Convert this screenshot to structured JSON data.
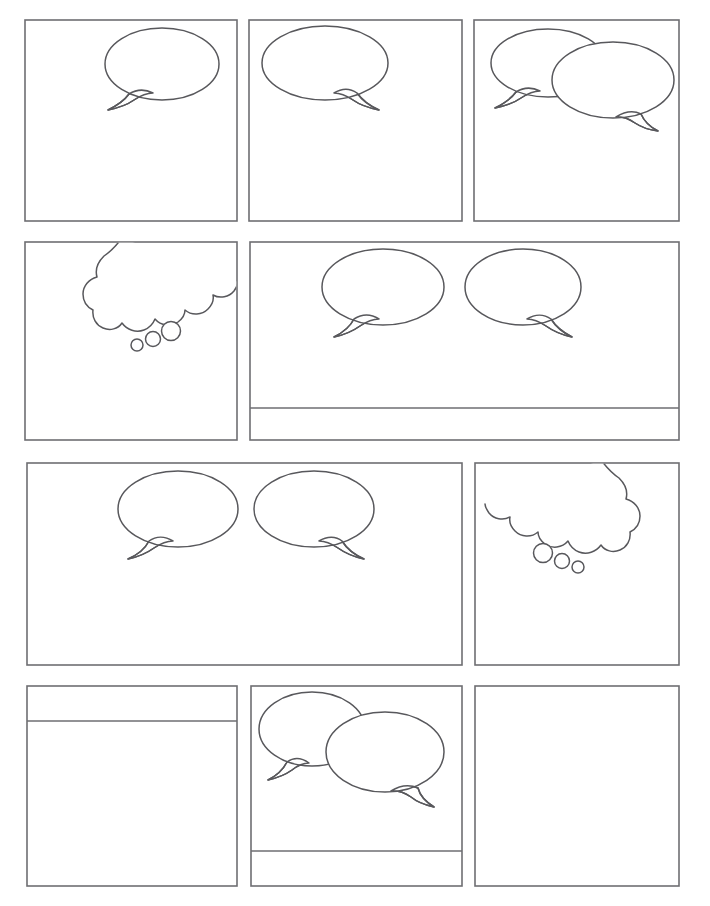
{
  "document": {
    "kind": "comic-page-template",
    "title": "Blank Comic Book Page Template",
    "page_width": 710,
    "page_height": 906,
    "background_color": "#ffffff",
    "panel_border_color": "#6e6e72",
    "bubble_line_color": "#58585c",
    "bubble_fill_color": "#ffffff",
    "panel_border_width": 1.6,
    "bubble_line_width": 1.5,
    "row_count": 4,
    "panel_count": 11,
    "text_content": []
  },
  "rows": [
    {
      "name": "row-1",
      "index": 1,
      "top": 20,
      "bottom": 221,
      "panel_count": 3,
      "panels": [
        {
          "name": "panel-1",
          "label": "1",
          "x": 25,
          "y": 20,
          "width": 212,
          "height": 201,
          "caption_bar": null,
          "balloons": [
            {
              "type": "speech",
              "cx": 162,
              "cy": 64,
              "rx": 57,
              "ry": 36,
              "tail": "lower-left",
              "tail_path": "M 129 94 C 124 101 116 106 108 110 C 118 108 127 105 134 100 C 140 96 146 93 153 93 C 145 89 137 89 129 94 Z",
              "z": 1
            }
          ]
        },
        {
          "name": "panel-2",
          "label": "2",
          "x": 249,
          "y": 20,
          "width": 213,
          "height": 201,
          "caption_bar": null,
          "balloons": [
            {
              "type": "speech",
              "cx": 325,
              "cy": 63,
              "rx": 63,
              "ry": 37,
              "tail": "lower-right",
              "tail_path": "M 357 93 C 362 100 370 106 379 110 C 369 108 360 105 353 100 C 347 96 341 93 334 93 C 342 88 350 88 357 93 Z",
              "z": 1
            }
          ]
        },
        {
          "name": "panel-3",
          "label": "3",
          "x": 474,
          "y": 20,
          "width": 205,
          "height": 201,
          "caption_bar": null,
          "balloons": [
            {
              "type": "speech",
              "cx": 548,
              "cy": 63,
              "rx": 57,
              "ry": 34,
              "tail": "lower-left",
              "tail_path": "M 516 92 C 511 99 503 104 495 108 C 505 106 514 103 521 98 C 527 94 533 91 540 91 C 532 87 524 87 516 92 Z",
              "z": 1
            },
            {
              "type": "speech",
              "cx": 613,
              "cy": 80,
              "rx": 61,
              "ry": 38,
              "tail": "lower-left",
              "tail_path": "M 641 114 C 644 121 650 127 658 131 C 649 130 641 127 635 123 C 629 119 623 116 616 117 C 624 112 633 110 641 114 Z",
              "z": 2
            }
          ]
        }
      ]
    },
    {
      "name": "row-2",
      "index": 2,
      "top": 242,
      "bottom": 440,
      "panel_count": 2,
      "panels": [
        {
          "name": "panel-4",
          "label": "4",
          "x": 25,
          "y": 242,
          "width": 212,
          "height": 198,
          "caption_bar": null,
          "balloons": [
            {
              "type": "thought",
              "orientation": "cloud-left-dots-down-left",
              "clipped_top": true,
              "cloud_path": "M 122 238 C 116 246 110 252 104 256 C 98 262 95 270 97 277 C 89 279 83 286 83 294 C 83 301 87 307 93 310 C 92 318 96 325 103 328 C 110 331 118 329 122 323 C 127 330 136 333 144 330 C 149 328 153 324 155 319 C 161 326 171 327 178 322 C 182 319 185 315 185 310 C 192 316 202 315 208 309 C 212 305 214 300 213 295 C 220 299 229 297 234 291 C 236 288 238 285 238 282",
              "dots": [
                {
                  "cx": 171,
                  "cy": 331,
                  "r": 9.5,
                  "index": 1
                },
                {
                  "cx": 153,
                  "cy": 339,
                  "r": 7.5,
                  "index": 2
                },
                {
                  "cx": 137,
                  "cy": 345,
                  "r": 6,
                  "index": 3
                }
              ],
              "z": 1
            }
          ]
        },
        {
          "name": "panel-5",
          "label": "5",
          "x": 250,
          "y": 242,
          "width": 429,
          "height": 198,
          "caption_bar": {
            "name": "caption-bottom",
            "divider_y": 408,
            "position": "bottom",
            "height": 32
          },
          "balloons": [
            {
              "type": "speech",
              "cx": 383,
              "cy": 287,
              "rx": 61,
              "ry": 38,
              "tail": "lower-left",
              "tail_path": "M 354 319 C 350 327 342 333 334 337 C 344 335 353 331 360 326 C 366 322 372 319 379 319 C 371 314 362 314 354 319 Z",
              "z": 1
            },
            {
              "type": "speech",
              "cx": 523,
              "cy": 287,
              "rx": 58,
              "ry": 38,
              "tail": "lower-right",
              "tail_path": "M 551 319 C 556 327 564 333 572 337 C 562 335 553 331 546 326 C 540 322 534 319 527 319 C 535 314 544 314 551 319 Z",
              "z": 1
            }
          ]
        }
      ]
    },
    {
      "name": "row-3",
      "index": 3,
      "top": 463,
      "bottom": 665,
      "panel_count": 2,
      "panels": [
        {
          "name": "panel-6",
          "label": "6",
          "x": 27,
          "y": 463,
          "width": 435,
          "height": 202,
          "caption_bar": null,
          "balloons": [
            {
              "type": "speech",
              "cx": 178,
              "cy": 509,
              "rx": 60,
              "ry": 38,
              "tail": "lower-left",
              "tail_path": "M 149 541 C 145 549 137 555 128 559 C 138 557 147 553 154 548 C 160 544 166 541 173 541 C 165 536 156 536 149 541 Z",
              "z": 1
            },
            {
              "type": "speech",
              "cx": 314,
              "cy": 509,
              "rx": 60,
              "ry": 38,
              "tail": "lower-right",
              "tail_path": "M 342 541 C 347 549 355 555 364 559 C 354 557 345 553 338 548 C 332 544 326 541 319 541 C 327 536 336 536 342 541 Z",
              "z": 1
            }
          ]
        },
        {
          "name": "panel-7",
          "label": "7",
          "x": 475,
          "y": 463,
          "width": 204,
          "height": 202,
          "caption_bar": null,
          "balloons": [
            {
              "type": "thought",
              "orientation": "cloud-right-dots-down-right",
              "clipped_top": true,
              "cloud_path": "M 601 460 C 607 468 613 474 619 478 C 625 484 628 492 626 499 C 634 501 640 508 640 516 C 640 523 636 529 630 532 C 631 540 627 547 620 550 C 613 553 605 551 601 545 C 596 552 587 555 579 552 C 574 550 570 546 568 541 C 562 548 552 549 545 544 C 541 541 538 537 538 532 C 531 538 521 537 515 531 C 511 527 509 522 510 517 C 503 521 494 519 489 513 C 487 510 485 507 485 504",
              "dots": [
                {
                  "cx": 543,
                  "cy": 553,
                  "r": 9.5,
                  "index": 1
                },
                {
                  "cx": 562,
                  "cy": 561,
                  "r": 7.5,
                  "index": 2
                },
                {
                  "cx": 578,
                  "cy": 567,
                  "r": 6,
                  "index": 3
                }
              ],
              "z": 1
            }
          ]
        }
      ]
    },
    {
      "name": "row-4",
      "index": 4,
      "top": 686,
      "bottom": 886,
      "panel_count": 3,
      "panels": [
        {
          "name": "panel-8",
          "label": "8",
          "x": 27,
          "y": 686,
          "width": 210,
          "height": 200,
          "caption_bar": {
            "name": "caption-top",
            "divider_y": 721,
            "position": "top",
            "height": 35
          },
          "balloons": []
        },
        {
          "name": "panel-9",
          "label": "9",
          "x": 251,
          "y": 686,
          "width": 211,
          "height": 200,
          "caption_bar": {
            "name": "caption-bottom",
            "divider_y": 851,
            "position": "bottom",
            "height": 35
          },
          "balloons": [
            {
              "type": "speech",
              "cx": 312,
              "cy": 729,
              "rx": 53,
              "ry": 37,
              "tail": "lower-left",
              "tail_path": "M 287 762 C 283 770 276 776 268 780 C 277 778 285 775 292 770 C 297 766 303 763 309 763 C 302 758 294 757 287 762 Z",
              "z": 1
            },
            {
              "type": "speech",
              "cx": 385,
              "cy": 752,
              "rx": 59,
              "ry": 40,
              "tail": "lower-left",
              "tail_path": "M 418 788 C 420 796 426 802 434 807 C 425 805 417 802 411 797 C 405 793 398 790 391 791 C 399 786 409 784 418 788 Z",
              "z": 2
            }
          ]
        },
        {
          "name": "panel-10",
          "label": "10",
          "x": 475,
          "y": 686,
          "width": 204,
          "height": 200,
          "caption_bar": null,
          "balloons": []
        }
      ]
    }
  ]
}
